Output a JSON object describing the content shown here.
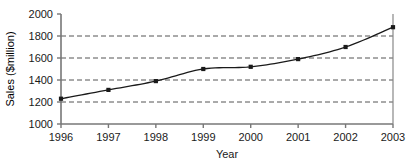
{
  "chart_data": {
    "type": "line",
    "title": "",
    "xlabel": "Year",
    "ylabel": "Sales ($million)",
    "categories": [
      "1996",
      "1997",
      "1998",
      "1999",
      "2000",
      "2001",
      "2002",
      "2003"
    ],
    "x": [
      1996,
      1997,
      1998,
      1999,
      2000,
      2001,
      2002,
      2003
    ],
    "values": [
      1230,
      1310,
      1390,
      1500,
      1520,
      1590,
      1700,
      1880
    ],
    "series": [
      {
        "name": "Sales",
        "values": [
          1230,
          1310,
          1390,
          1500,
          1520,
          1590,
          1700,
          1880
        ]
      }
    ],
    "ylim": [
      1000,
      2000
    ],
    "ytick_labels": [
      "1000",
      "1200",
      "1400",
      "1600",
      "1800",
      "2000"
    ],
    "yticks": [
      1000,
      1200,
      1400,
      1600,
      1800,
      2000
    ],
    "xtick_labels": [
      "1996",
      "1997",
      "1998",
      "1999",
      "2000",
      "2001",
      "2002",
      "2003"
    ],
    "grid": "horizontal-dashed",
    "legend": "none",
    "marker": "filled-square",
    "line_color": "#1a1a1a",
    "grid_color": "#555555",
    "axis_color": "#777777",
    "background": "#ffffff"
  },
  "axes": {
    "y_ticks": [
      {
        "label": "2000",
        "value": 2000
      },
      {
        "label": "1800",
        "value": 1800
      },
      {
        "label": "1600",
        "value": 1600
      },
      {
        "label": "1400",
        "value": 1400
      },
      {
        "label": "1200",
        "value": 1200
      },
      {
        "label": "1000",
        "value": 1000
      }
    ],
    "x_ticks": [
      {
        "label": "1996",
        "value": 1996
      },
      {
        "label": "1997",
        "value": 1997
      },
      {
        "label": "1998",
        "value": 1998
      },
      {
        "label": "1999",
        "value": 1999
      },
      {
        "label": "2000",
        "value": 2000
      },
      {
        "label": "2001",
        "value": 2001
      },
      {
        "label": "2002",
        "value": 2002
      },
      {
        "label": "2003",
        "value": 2003
      }
    ],
    "x_title": "Year",
    "y_title": "Sales ($million)"
  }
}
